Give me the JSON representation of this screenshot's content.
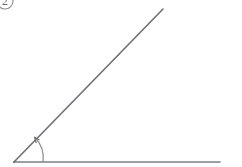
{
  "figure": {
    "background_color": "#ffffff",
    "width": 242,
    "height": 167,
    "stroke_color": "#7b7b80",
    "badge": {
      "label": "2",
      "shape": "circle",
      "clipped": true,
      "center_x": 5,
      "center_y": 1,
      "radius": 8,
      "stroke_color": "#8a8a8a",
      "text_color": "#6d6d6d"
    },
    "vertex": {
      "label": "",
      "x": 14,
      "y": 162
    },
    "rays": [
      {
        "name": "horizontal-ray",
        "from_x": 14,
        "from_y": 162,
        "to_x": 220,
        "to_y": 162,
        "stroke_color": "#808085",
        "stroke_width": 1.6
      },
      {
        "name": "diagonal-ray",
        "from_x": 14,
        "from_y": 162,
        "to_x": 163,
        "to_y": 9,
        "stroke_color": "#6f6f75",
        "stroke_width": 1.6
      }
    ],
    "angle_arc": {
      "name": "angle-arc",
      "center_x": 14,
      "center_y": 162,
      "radius": 29,
      "start_x": 43,
      "start_y": 162,
      "end_x": 34.6,
      "end_y": 137.2,
      "stroke_color": "#8a8a90",
      "stroke_width": 1.2,
      "arrowhead": true,
      "arrowhead_x": 34.6,
      "arrowhead_y": 137.2,
      "measure_label": ""
    }
  }
}
